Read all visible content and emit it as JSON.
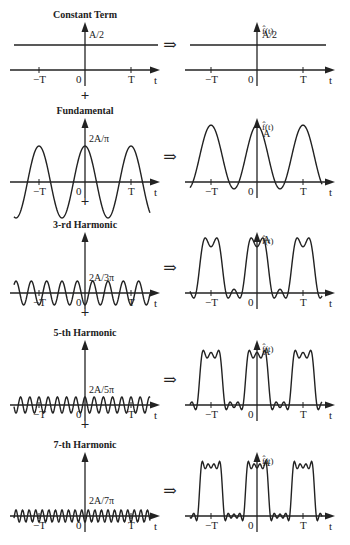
{
  "rows": [
    {
      "title": "Constant Term",
      "amp_label": "A/2",
      "result_label": "A/2",
      "harmonic": 0
    },
    {
      "title": "Fundamental",
      "amp_label": "2A/π",
      "result_label": "A",
      "harmonic": 1
    },
    {
      "title": "3-rd Harmonic",
      "amp_label": "2A/3π",
      "result_label": "A",
      "harmonic": 3
    },
    {
      "title": "5-th Harmonic",
      "amp_label": "2A/5π",
      "result_label": "A",
      "harmonic": 5
    },
    {
      "title": "7-th Harmonic",
      "amp_label": "2A/7π",
      "result_label": "A",
      "harmonic": 7
    }
  ],
  "axis": {
    "neg_T": "−T",
    "zero": "0",
    "pos_T": "T",
    "t": "t",
    "fhat": "f̂(t)"
  },
  "operators": {
    "plus": "+",
    "implies": "⇒"
  },
  "colors": {
    "ink": "#222222",
    "background": "#ffffff"
  }
}
